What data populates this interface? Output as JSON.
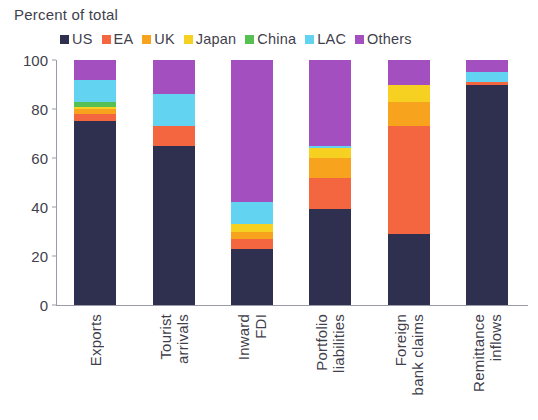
{
  "axis_title": "Percent of total",
  "legend": {
    "entries": [
      {
        "label": "US",
        "color": "#2f3050"
      },
      {
        "label": "EA",
        "color": "#f4663f"
      },
      {
        "label": "UK",
        "color": "#f7a31e"
      },
      {
        "label": "Japan",
        "color": "#f6d122"
      },
      {
        "label": "China",
        "color": "#56c152"
      },
      {
        "label": "LAC",
        "color": "#62d3f0"
      },
      {
        "label": "Others",
        "color": "#a44fc0"
      }
    ]
  },
  "yaxis": {
    "ticks": [
      "0",
      "20",
      "40",
      "60",
      "80",
      "100"
    ],
    "min": 0,
    "max": 100
  },
  "chart_data": {
    "type": "bar",
    "stacked": true,
    "stack_mode": "percent",
    "title": "",
    "subtitle": "",
    "xlabel": "",
    "ylabel": "Percent of total",
    "ylim": [
      0,
      100
    ],
    "yticks": [
      0,
      20,
      40,
      60,
      80,
      100
    ],
    "grid": false,
    "legend_position": "top",
    "categories": [
      "Exports",
      "Tourist arrivals",
      "Inward FDI",
      "Portfolio liabilities",
      "Foreign bank claims",
      "Remittance inflows"
    ],
    "category_lines": [
      [
        "Exports"
      ],
      [
        "Tourist",
        "arrivals"
      ],
      [
        "Inward",
        "FDI"
      ],
      [
        "Portfolio",
        "liabilities"
      ],
      [
        "Foreign",
        "bank claims"
      ],
      [
        "Remittance",
        "inflows"
      ]
    ],
    "series": [
      {
        "name": "US",
        "color": "#2f3050",
        "values": [
          75,
          65,
          23,
          39,
          29,
          90
        ]
      },
      {
        "name": "EA",
        "color": "#f4663f",
        "values": [
          3,
          8,
          4,
          13,
          44,
          1
        ]
      },
      {
        "name": "UK",
        "color": "#f7a31e",
        "values": [
          2,
          0,
          3,
          8,
          10,
          0
        ]
      },
      {
        "name": "Japan",
        "color": "#f6d122",
        "values": [
          1,
          0,
          3,
          4,
          7,
          0
        ]
      },
      {
        "name": "China",
        "color": "#56c152",
        "values": [
          2,
          0,
          0,
          0,
          0,
          0
        ]
      },
      {
        "name": "LAC",
        "color": "#62d3f0",
        "values": [
          9,
          13,
          9,
          1,
          0,
          4
        ]
      },
      {
        "name": "Others",
        "color": "#a44fc0",
        "values": [
          8,
          14,
          58,
          35,
          10,
          5
        ]
      }
    ]
  }
}
